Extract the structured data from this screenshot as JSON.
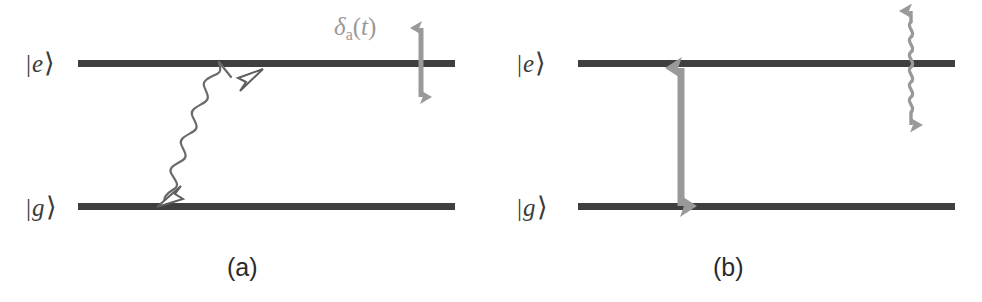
{
  "figure": {
    "type": "energy-level-diagram",
    "width": 982,
    "height": 302,
    "background_color": "#ffffff",
    "level_line_color": "#3f3f3f",
    "arrow_gray_color": "#999999",
    "wavy_arrow_color": "#6b6b6b",
    "text_color": "#333333"
  },
  "panels": [
    {
      "id": "a",
      "caption": "(a)",
      "levels": [
        {
          "id": "excited",
          "ket_bar": "|",
          "ket_letter": "e",
          "ket_angle": "⟩"
        },
        {
          "id": "ground",
          "ket_bar": "|",
          "ket_letter": "g",
          "ket_angle": "⟩"
        }
      ],
      "annotations": [
        {
          "id": "detuning",
          "symbol": "δ",
          "subscript": "a",
          "open_paren": "(",
          "variable": "t",
          "close_paren": ")",
          "full_text": "δₐ(t)",
          "color": "#999999",
          "arrow": "vertical-double-headed-straight"
        },
        {
          "id": "spontaneous-emission",
          "arrow": "diagonal-double-headed-wavy",
          "color": "#6b6b6b"
        }
      ]
    },
    {
      "id": "b",
      "caption": "(b)",
      "levels": [
        {
          "id": "excited",
          "ket_bar": "|",
          "ket_letter": "e",
          "ket_angle": "⟩"
        },
        {
          "id": "ground",
          "ket_bar": "|",
          "ket_letter": "g",
          "ket_angle": "⟩"
        }
      ],
      "annotations": [
        {
          "id": "rabi-frequency",
          "symbol": "Ω",
          "open_paren": "(",
          "variable": "t",
          "close_paren": ")",
          "full_text": "Ω(t)",
          "color": "#999999",
          "arrow": "vertical-double-headed-straight-coupling"
        },
        {
          "id": "decay-channel",
          "arrow": "vertical-double-headed-wavy",
          "color": "#999999"
        }
      ]
    }
  ]
}
